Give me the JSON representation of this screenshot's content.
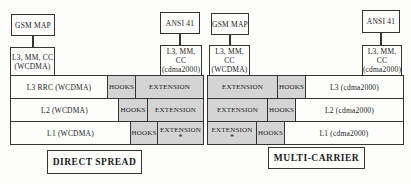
{
  "figure": {
    "colors": {
      "shaded_fill": "#d4d4d4",
      "box_fill": "#fdfdfc",
      "border": "#343434"
    },
    "left": {
      "gsm_map": "GSM MAP",
      "ansi_41": "ANSI 41",
      "wcdma_signaling": {
        "line1": "L3, MM, CC",
        "line2": "(WCDMA)"
      },
      "cdma_signaling": {
        "line1": "L3, MM, CC",
        "line2": "(cdma2000)"
      },
      "rows": [
        {
          "layer": "L3 RRC (WCDMA)",
          "hooks": "HOOKS",
          "extension": "EXTENSION"
        },
        {
          "layer": "L2 (WCDMA)",
          "hooks": "HOOKS",
          "extension": "EXTENSION"
        },
        {
          "layer": "L1 (WCDMA)",
          "hooks": "HOOKS",
          "extension": "EXTENSION",
          "footnote": "*"
        }
      ],
      "caption": "DIRECT SPREAD"
    },
    "right": {
      "gsm_map": "GSM MAP",
      "ansi_41": "ANSI 41",
      "wcdma_signaling": {
        "line1": "L3, MM, CC",
        "line2": "(WCDMA)"
      },
      "cdma_signaling": {
        "line1": "L3, MM, CC",
        "line2": "(cdma2000)"
      },
      "rows": [
        {
          "extension": "EXTENSION",
          "hooks": "HOOKS",
          "layer": "L3 (cdma2000)"
        },
        {
          "extension": "EXTENSION",
          "hooks": "HOOKS",
          "layer": "L2 (cdma2000)"
        },
        {
          "extension": "EXTENSION",
          "footnote": "*",
          "hooks": "HOOKS",
          "layer": "L1 (cdma2000)"
        }
      ],
      "caption": "MULTI-CARRIER"
    }
  }
}
